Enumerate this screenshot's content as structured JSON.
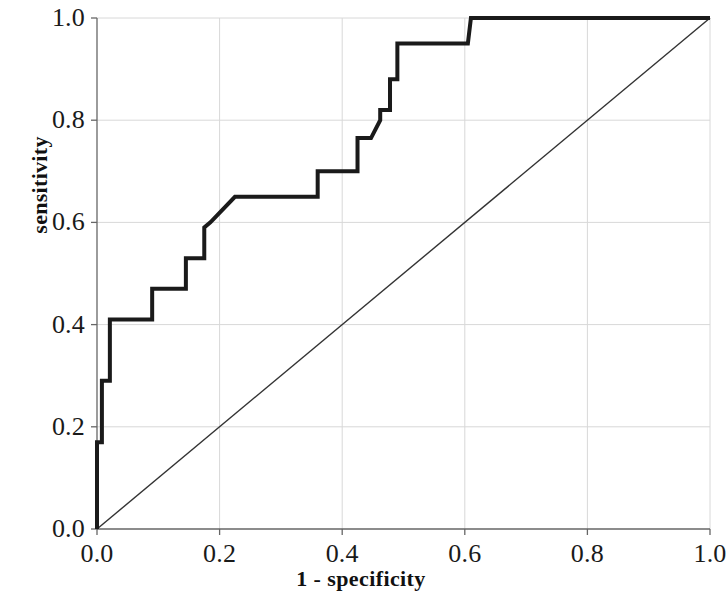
{
  "chart_data": {
    "type": "line",
    "title": "",
    "xlabel": "1 - specificity",
    "ylabel": "sensitivity",
    "xlim": [
      0.0,
      1.0
    ],
    "ylim": [
      0.0,
      1.0
    ],
    "grid": true,
    "legend": null,
    "xticks": [
      "0.0",
      "0.2",
      "0.4",
      "0.6",
      "0.8",
      "1.0"
    ],
    "xtick_values": [
      0.0,
      0.2,
      0.4,
      0.6,
      0.8,
      1.0
    ],
    "yticks": [
      "0.0",
      "0.2",
      "0.4",
      "0.6",
      "0.8",
      "1.0"
    ],
    "ytick_values": [
      0.0,
      0.2,
      0.4,
      0.6,
      0.8,
      1.0
    ],
    "series": [
      {
        "name": "ROC curve",
        "style": "step",
        "linewidth": 4,
        "color": "#1a1a1a",
        "x": [
          0.0,
          0.0,
          0.008,
          0.008,
          0.021,
          0.021,
          0.09,
          0.09,
          0.145,
          0.145,
          0.175,
          0.175,
          0.185,
          0.225,
          0.36,
          0.36,
          0.425,
          0.425,
          0.447,
          0.462,
          0.462,
          0.478,
          0.478,
          0.49,
          0.49,
          0.605,
          0.61,
          1.0
        ],
        "y": [
          0.0,
          0.17,
          0.17,
          0.29,
          0.29,
          0.41,
          0.41,
          0.47,
          0.47,
          0.53,
          0.53,
          0.59,
          0.6,
          0.65,
          0.65,
          0.7,
          0.7,
          0.765,
          0.765,
          0.8,
          0.82,
          0.82,
          0.88,
          0.88,
          0.95,
          0.95,
          1.0,
          1.0
        ]
      },
      {
        "name": "reference diagonal",
        "style": "line",
        "linewidth": 1.4,
        "color": "#333333",
        "x": [
          0.0,
          1.0
        ],
        "y": [
          0.0,
          1.0
        ]
      }
    ]
  },
  "axes": {
    "x_title": "1 - specificity",
    "y_title": "sensitivity",
    "x_tick_labels": [
      "0.0",
      "0.2",
      "0.4",
      "0.6",
      "0.8",
      "1.0"
    ],
    "y_tick_labels": [
      "0.0",
      "0.2",
      "0.4",
      "0.6",
      "0.8",
      "1.0"
    ]
  },
  "colors": {
    "curve": "#1a1a1a",
    "diagonal": "#333333",
    "axis": "#555555",
    "grid": "#d8d8d8",
    "background": "#ffffff",
    "text": "#1a1a1a"
  }
}
